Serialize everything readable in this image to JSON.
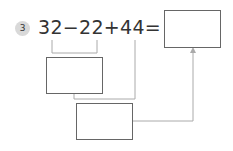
{
  "problem": {
    "number": "3",
    "expression": "32−22+44="
  },
  "boxes": [
    {
      "id": "result-box",
      "value": ""
    },
    {
      "id": "step1-box",
      "value": ""
    },
    {
      "id": "step2-box",
      "value": ""
    }
  ],
  "colors": {
    "line": "#aaaaaa",
    "box_border": "#666666",
    "badge": "#d9d9d9"
  }
}
